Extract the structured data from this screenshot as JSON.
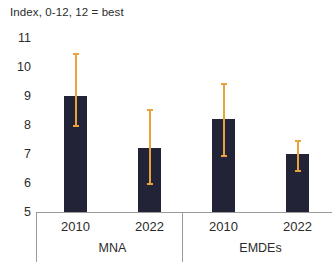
{
  "chart_data": {
    "type": "bar",
    "title": "Index, 0-12, 12 = best",
    "xlabel": "",
    "ylabel": "",
    "ylim": [
      5,
      11
    ],
    "yticks": [
      5,
      6,
      7,
      8,
      9,
      10,
      11
    ],
    "ytick_labels": [
      "5",
      "6",
      "7",
      "8",
      "9",
      "10",
      "11"
    ],
    "grid": false,
    "legend": null,
    "categories": [
      "2010",
      "2022",
      "2010",
      "2022"
    ],
    "groups": [
      {
        "label": "MNA",
        "categories": [
          "2010",
          "2022"
        ]
      },
      {
        "label": "EMDEs",
        "categories": [
          "2010",
          "2022"
        ]
      }
    ],
    "series": [
      {
        "name": "Index",
        "values": [
          9.0,
          7.2,
          8.2,
          7.0
        ],
        "color": "#232338"
      }
    ],
    "error_bars": {
      "color": "#e8a33d",
      "low": [
        8.0,
        6.0,
        6.95,
        6.45
      ],
      "high": [
        10.5,
        8.55,
        9.45,
        7.5
      ]
    },
    "points": [
      {
        "group": "MNA",
        "category": "2010",
        "value": 9.0,
        "low": 8.0,
        "high": 10.5
      },
      {
        "group": "MNA",
        "category": "2022",
        "value": 7.2,
        "low": 6.0,
        "high": 8.55
      },
      {
        "group": "EMDEs",
        "category": "2010",
        "value": 8.2,
        "low": 6.95,
        "high": 9.45
      },
      {
        "group": "EMDEs",
        "category": "2022",
        "value": 7.0,
        "low": 6.45,
        "high": 7.5
      }
    ],
    "colors": {
      "bar": "#232338",
      "error_bar": "#e8a33d",
      "axis": "#9a9a9a",
      "text": "#2b2b2b",
      "background": "#ffffff"
    }
  }
}
